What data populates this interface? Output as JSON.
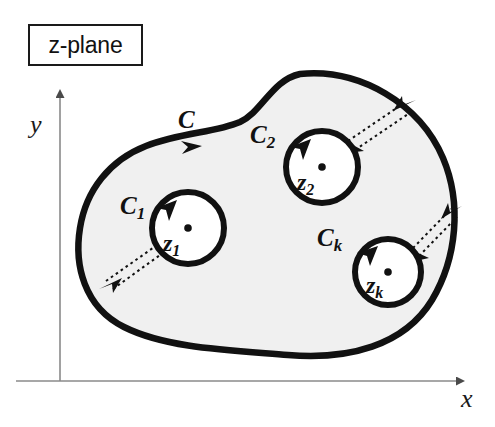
{
  "figure": {
    "title_box": "z-plane",
    "background_color": "#ffffff",
    "region_fill_color": "#f0f0f0",
    "stroke_color": "#111111"
  },
  "axes": {
    "y_label": "y",
    "x_label": "x",
    "axis_color": "#7a7a7a",
    "origin": {
      "x": 60,
      "y": 381
    }
  },
  "contours": {
    "outer": {
      "label": "C",
      "orientation": "clockwise"
    },
    "inner": [
      {
        "label": "C",
        "subscript": "1",
        "point_label": "z",
        "point_subscript": "1",
        "center": {
          "x": 188,
          "y": 228
        },
        "radius": 36,
        "orientation": "counterclockwise"
      },
      {
        "label": "C",
        "subscript": "2",
        "point_label": "z",
        "point_subscript": "2",
        "center": {
          "x": 322,
          "y": 167
        },
        "radius": 36,
        "orientation": "counterclockwise"
      },
      {
        "label": "C",
        "subscript": "k",
        "point_label": "z",
        "point_subscript": "k",
        "center": {
          "x": 388,
          "y": 272
        },
        "radius": 33,
        "orientation": "counterclockwise"
      }
    ]
  },
  "cuts": [
    {
      "name": "cut-to-c1"
    },
    {
      "name": "cut-to-c2"
    },
    {
      "name": "cut-to-ck"
    }
  ]
}
